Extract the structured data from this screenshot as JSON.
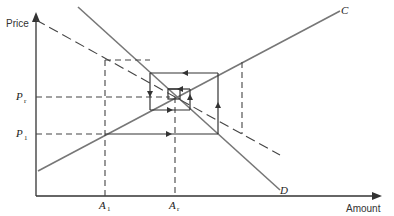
{
  "axes": {
    "y_label": "Price",
    "x_label": "Amount"
  },
  "curves": {
    "supply_label": "C",
    "demand_label": "D"
  },
  "price_ticks": [
    {
      "main": "P",
      "sub": "r"
    },
    {
      "main": "P",
      "sub": "1"
    }
  ],
  "amount_ticks": [
    {
      "main": "A",
      "sub": "1"
    },
    {
      "main": "A",
      "sub": "r"
    }
  ],
  "colors": {
    "axis": "#333333",
    "curve": "#777777",
    "line": "#444444",
    "background": "#ffffff"
  }
}
